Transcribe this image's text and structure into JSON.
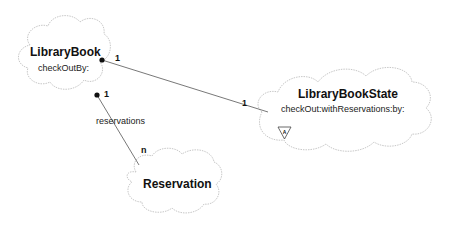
{
  "diagram": {
    "type": "Booch class diagram",
    "classes": [
      {
        "id": "library-book",
        "name": "LibraryBook",
        "operations": "checkOutBy:"
      },
      {
        "id": "library-book-state",
        "name": "LibraryBookState",
        "operations": "checkOut:withReservations:by:",
        "adornment": "A"
      },
      {
        "id": "reservation",
        "name": "Reservation",
        "operations": ""
      }
    ],
    "associations": [
      {
        "from": "LibraryBook",
        "to": "LibraryBookState",
        "from_multiplicity": "1",
        "to_multiplicity": "1",
        "role": ""
      },
      {
        "from": "LibraryBook",
        "to": "Reservation",
        "from_multiplicity": "1",
        "to_multiplicity": "n",
        "role": "reservations"
      }
    ],
    "colors": {
      "cloud_stroke": "#c8c8c8",
      "line": "#555555",
      "text": "#111111"
    }
  }
}
